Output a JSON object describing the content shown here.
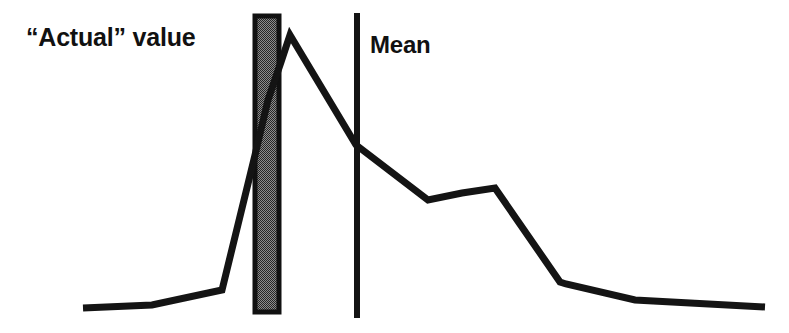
{
  "figure": {
    "background_color": "#ffffff",
    "width": 789,
    "height": 333,
    "curve_color": "#141414",
    "bar_outline_color": "#111111",
    "bar_fill_color": "#6e6e6e",
    "mean_line_color": "#141414"
  },
  "labels": {
    "actual_value": "“Actual” value",
    "mean": "Mean"
  },
  "annotations": {
    "actual_value_bar": {
      "name": "Actual value band",
      "x_left": 253,
      "x_right": 281,
      "y_top": 14,
      "y_bottom": 314,
      "fill": "hatched-gray"
    },
    "mean_line": {
      "name": "Mean",
      "x": 357,
      "y_top": 13,
      "y_bottom": 318
    }
  },
  "chart_data": {
    "type": "line",
    "title": "",
    "subtitle": "",
    "xlabel": "",
    "ylabel": "",
    "grid": false,
    "legend_position": "none",
    "axes_visible": false,
    "xlim": [
      0,
      789
    ],
    "ylim": [
      333,
      0
    ],
    "series": [
      {
        "name": "distribution",
        "points": [
          [
            83,
            308
          ],
          [
            152,
            305
          ],
          [
            222,
            290
          ],
          [
            255,
            155
          ],
          [
            268,
            100
          ],
          [
            281,
            62
          ],
          [
            290,
            35
          ],
          [
            356,
            145
          ],
          [
            428,
            200
          ],
          [
            462,
            193
          ],
          [
            495,
            188
          ],
          [
            560,
            282
          ],
          [
            566,
            284
          ],
          [
            635,
            300
          ],
          [
            765,
            307
          ]
        ]
      }
    ],
    "annotations": [
      {
        "label": "“Actual” value",
        "type": "vertical-band",
        "x_start": 253,
        "x_end": 281
      },
      {
        "label": "Mean",
        "type": "vertical-line",
        "x": 357
      }
    ]
  }
}
